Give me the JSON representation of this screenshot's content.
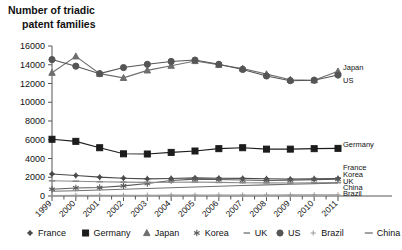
{
  "chart_data": {
    "type": "line",
    "title": "Number of triadic\npatent families",
    "title_line1": "Number of triadic",
    "title_line2": "patent families",
    "xlabel": "",
    "ylabel": "",
    "ylim": [
      0,
      16000
    ],
    "ytick_step": 2000,
    "yticks": [
      0,
      2000,
      4000,
      6000,
      8000,
      10000,
      12000,
      14000,
      16000
    ],
    "categories": [
      "1999",
      "2000",
      "2001",
      "2002",
      "2003",
      "2004",
      "2005",
      "2006",
      "2007",
      "2008",
      "2009",
      "2010",
      "2011"
    ],
    "grid": false,
    "legend_position": "bottom",
    "series": [
      {
        "name": "France",
        "marker": "plus-star",
        "color": "#4a4a4a",
        "end_label": "France",
        "values": [
          2350,
          2190,
          2010,
          1900,
          1830,
          1870,
          1930,
          1900,
          1880,
          1840,
          1800,
          1830,
          1860
        ]
      },
      {
        "name": "Germany",
        "marker": "square",
        "color": "#1c1c1c",
        "end_label": "Germany",
        "values": [
          6050,
          5830,
          5150,
          4500,
          4480,
          4650,
          4800,
          5050,
          5150,
          5000,
          5000,
          5050,
          5080
        ]
      },
      {
        "name": "Japan",
        "marker": "triangle",
        "color": "#6e6e6e",
        "end_label": "Japan",
        "values": [
          13150,
          14900,
          13050,
          12600,
          13400,
          13900,
          14400,
          14000,
          13600,
          13000,
          12400,
          12350,
          13300
        ]
      },
      {
        "name": "Korea",
        "marker": "asterisk",
        "color": "#5a5a5a",
        "end_label": "Korea",
        "values": [
          720,
          860,
          900,
          1080,
          1330,
          1650,
          1800,
          1760,
          1700,
          1660,
          1680,
          1750,
          1800
        ]
      },
      {
        "name": "UK",
        "marker": "dash",
        "color": "#8a8a8a",
        "end_label": "UK",
        "values": [
          1620,
          1580,
          1520,
          1480,
          1450,
          1470,
          1500,
          1450,
          1420,
          1400,
          1380,
          1400,
          1430
        ]
      },
      {
        "name": "US",
        "marker": "circle",
        "color": "#555555",
        "end_label": "US",
        "values": [
          14550,
          13850,
          13050,
          13700,
          14050,
          14350,
          14500,
          14050,
          13500,
          12800,
          12300,
          12350,
          12900
        ]
      },
      {
        "name": "Brazil",
        "marker": "plus",
        "color": "#9a9a9a",
        "end_label": "Brazil",
        "values": [
          60,
          65,
          70,
          75,
          80,
          90,
          95,
          100,
          105,
          110,
          115,
          120,
          125
        ]
      },
      {
        "name": "China",
        "marker": "line",
        "color": "#707070",
        "end_label": "China",
        "values": [
          500,
          560,
          640,
          720,
          800,
          880,
          960,
          1040,
          1120,
          1190,
          1250,
          1310,
          1380
        ]
      }
    ]
  },
  "legend": {
    "items": [
      {
        "label": "France",
        "marker": "plus-star"
      },
      {
        "label": "Germany",
        "marker": "square"
      },
      {
        "label": "Japan",
        "marker": "triangle"
      },
      {
        "label": "Korea",
        "marker": "asterisk"
      },
      {
        "label": "UK",
        "marker": "dash"
      },
      {
        "label": "US",
        "marker": "circle"
      },
      {
        "label": "Brazil",
        "marker": "plus"
      },
      {
        "label": "China",
        "marker": "line"
      }
    ]
  }
}
